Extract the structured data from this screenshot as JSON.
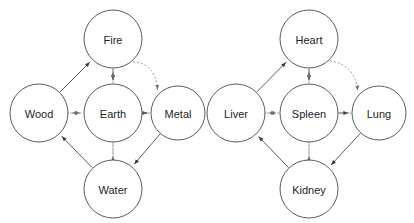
{
  "diagram": {
    "background_color": "#ffffff",
    "node_stroke_color": "#4a4a4a",
    "node_fill_color": "#ffffff",
    "label_color": "#1d1d1d",
    "generating_edge_color": "#4a4a4a",
    "controlling_edge_color": "#8d8d8d",
    "edge_styles": {
      "generating": "solid",
      "controlling": "dotted"
    },
    "panels": [
      {
        "id": "five-elements",
        "name": "Five Elements",
        "nodes": [
          {
            "id": "fire",
            "label": "Fire",
            "cx": 113,
            "cy": 39,
            "r": 29
          },
          {
            "id": "wood",
            "label": "Wood",
            "cx": 39,
            "cy": 113,
            "r": 29
          },
          {
            "id": "earth",
            "label": "Earth",
            "cx": 113,
            "cy": 113,
            "r": 29
          },
          {
            "id": "metal",
            "label": "Metal",
            "cx": 178,
            "cy": 113,
            "r": 27
          },
          {
            "id": "water",
            "label": "Water",
            "cx": 113,
            "cy": 189,
            "r": 29
          }
        ],
        "edges": [
          {
            "from": "wood",
            "to": "fire",
            "type": "generating",
            "style": "solid"
          },
          {
            "from": "fire",
            "to": "earth",
            "type": "generating",
            "style": "solid"
          },
          {
            "from": "earth",
            "to": "metal",
            "type": "generating",
            "style": "solid"
          },
          {
            "from": "metal",
            "to": "water",
            "type": "generating",
            "style": "solid"
          },
          {
            "from": "water",
            "to": "wood",
            "type": "generating",
            "style": "solid"
          },
          {
            "from": "fire",
            "to": "metal",
            "type": "controlling",
            "style": "dotted"
          },
          {
            "from": "metal",
            "to": "wood",
            "type": "controlling",
            "style": "dotted"
          },
          {
            "from": "wood",
            "to": "earth",
            "type": "controlling",
            "style": "dotted"
          },
          {
            "from": "earth",
            "to": "water",
            "type": "controlling",
            "style": "dotted"
          },
          {
            "from": "water",
            "to": "fire",
            "type": "controlling",
            "style": "dotted"
          }
        ]
      },
      {
        "id": "five-zang-organs",
        "name": "Five Zang Organs",
        "nodes": [
          {
            "id": "heart",
            "label": "Heart",
            "cx": 309,
            "cy": 39,
            "r": 29
          },
          {
            "id": "liver",
            "label": "Liver",
            "cx": 236,
            "cy": 113,
            "r": 29
          },
          {
            "id": "spleen",
            "label": "Spleen",
            "cx": 309,
            "cy": 113,
            "r": 29
          },
          {
            "id": "lung",
            "label": "Lung",
            "cx": 379,
            "cy": 113,
            "r": 27
          },
          {
            "id": "kidney",
            "label": "Kidney",
            "cx": 309,
            "cy": 189,
            "r": 29
          }
        ],
        "edges": [
          {
            "from": "liver",
            "to": "heart",
            "type": "generating",
            "style": "solid"
          },
          {
            "from": "heart",
            "to": "spleen",
            "type": "generating",
            "style": "solid"
          },
          {
            "from": "spleen",
            "to": "lung",
            "type": "generating",
            "style": "solid"
          },
          {
            "from": "lung",
            "to": "kidney",
            "type": "generating",
            "style": "solid"
          },
          {
            "from": "kidney",
            "to": "liver",
            "type": "generating",
            "style": "solid"
          },
          {
            "from": "heart",
            "to": "lung",
            "type": "controlling",
            "style": "dotted"
          },
          {
            "from": "lung",
            "to": "liver",
            "type": "controlling",
            "style": "dotted"
          },
          {
            "from": "liver",
            "to": "spleen",
            "type": "controlling",
            "style": "dotted"
          },
          {
            "from": "spleen",
            "to": "kidney",
            "type": "controlling",
            "style": "dotted"
          },
          {
            "from": "kidney",
            "to": "heart",
            "type": "controlling",
            "style": "dotted"
          }
        ]
      }
    ]
  }
}
